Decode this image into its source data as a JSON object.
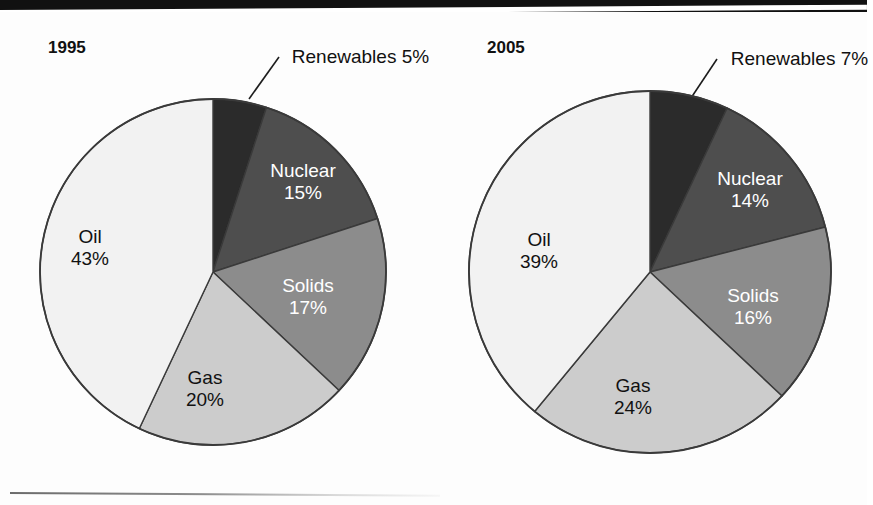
{
  "title": {
    "text": "Energy Consumption (cropped title banner)",
    "visible_fragment": ""
  },
  "chart_data": {
    "type": "pie",
    "title": "",
    "legend_position": "labels-on-slices",
    "charts": [
      {
        "id": "pie-1995",
        "year_label": "1995",
        "categories": [
          "Renewables",
          "Nuclear",
          "Solids",
          "Gas",
          "Oil"
        ],
        "values": [
          5,
          15,
          17,
          20,
          43
        ],
        "unit": "%",
        "start_angle_deg": 0,
        "direction": "clockwise",
        "slices": [
          {
            "name": "Renewables",
            "value": 5,
            "percent_text": "5%",
            "color": "#2b2b2b",
            "text_color": "#ffffff",
            "callout": true
          },
          {
            "name": "Nuclear",
            "value": 15,
            "percent_text": "15%",
            "color": "#4e4e4e",
            "text_color": "#ffffff",
            "callout": false
          },
          {
            "name": "Solids",
            "value": 17,
            "percent_text": "17%",
            "color": "#8c8c8c",
            "text_color": "#ffffff",
            "callout": false
          },
          {
            "name": "Gas",
            "value": 20,
            "percent_text": "20%",
            "color": "#cccccc",
            "text_color": "#111111",
            "callout": false
          },
          {
            "name": "Oil",
            "value": 43,
            "percent_text": "43%",
            "color": "#f2f2f2",
            "text_color": "#111111",
            "callout": false
          }
        ]
      },
      {
        "id": "pie-2005",
        "year_label": "2005",
        "categories": [
          "Renewables",
          "Nuclear",
          "Solids",
          "Gas",
          "Oil"
        ],
        "values": [
          7,
          14,
          16,
          24,
          39
        ],
        "unit": "%",
        "start_angle_deg": 0,
        "direction": "clockwise",
        "slices": [
          {
            "name": "Renewables",
            "value": 7,
            "percent_text": "7%",
            "color": "#2b2b2b",
            "text_color": "#ffffff",
            "callout": true
          },
          {
            "name": "Nuclear",
            "value": 14,
            "percent_text": "14%",
            "color": "#4e4e4e",
            "text_color": "#ffffff",
            "callout": false
          },
          {
            "name": "Solids",
            "value": 16,
            "percent_text": "16%",
            "color": "#8c8c8c",
            "text_color": "#ffffff",
            "callout": false
          },
          {
            "name": "Gas",
            "value": 24,
            "percent_text": "24%",
            "color": "#cccccc",
            "text_color": "#111111",
            "callout": false
          },
          {
            "name": "Oil",
            "value": 39,
            "percent_text": "39%",
            "color": "#f2f2f2",
            "text_color": "#111111",
            "callout": false
          }
        ]
      }
    ]
  },
  "labels": {
    "left": {
      "year": "1995",
      "renewables_name": "Renewables",
      "renewables_pct": "5%",
      "nuclear_name": "Nuclear",
      "nuclear_pct": "15%",
      "solids_name": "Solids",
      "solids_pct": "17%",
      "gas_name": "Gas",
      "gas_pct": "20%",
      "oil_name": "Oil",
      "oil_pct": "43%"
    },
    "right": {
      "year": "2005",
      "renewables_name": "Renewables",
      "renewables_pct": "7%",
      "nuclear_name": "Nuclear",
      "nuclear_pct": "14%",
      "solids_name": "Solids",
      "solids_pct": "16%",
      "gas_name": "Gas",
      "gas_pct": "24%",
      "oil_name": "Oil",
      "oil_pct": "39%"
    }
  },
  "colors": {
    "renewables": "#2b2b2b",
    "nuclear": "#4e4e4e",
    "solids": "#8c8c8c",
    "gas": "#cccccc",
    "oil": "#f2f2f2",
    "outline": "#3a3a3a",
    "banner": "#111111",
    "page": "#fdfdfd"
  }
}
